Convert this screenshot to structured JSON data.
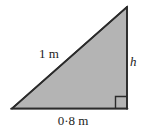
{
  "figure": {
    "type": "right-angled-triangle",
    "background_color": "#ffffff",
    "fill_color": "#b4b4b4",
    "stroke_color": "#2b2b2b",
    "stroke_width_px": 1.6,
    "vertices": {
      "left": {
        "x": 12,
        "y": 108.5
      },
      "top_right": {
        "x": 127,
        "y": 7
      },
      "bottom_right": {
        "x": 127,
        "y": 108.5
      }
    },
    "right_angle_marker": {
      "name": "right-angle-marker",
      "corner": "bottom-right",
      "size_px": 11,
      "stroke_color": "#2b2b2b"
    },
    "labels": {
      "hypotenuse": "1 m",
      "height": "h",
      "base": "0·8 m"
    },
    "measurements": {
      "hypotenuse_value": 1,
      "hypotenuse_unit": "m",
      "base_value": 0.8,
      "base_unit": "m",
      "height_symbol": "h"
    }
  }
}
